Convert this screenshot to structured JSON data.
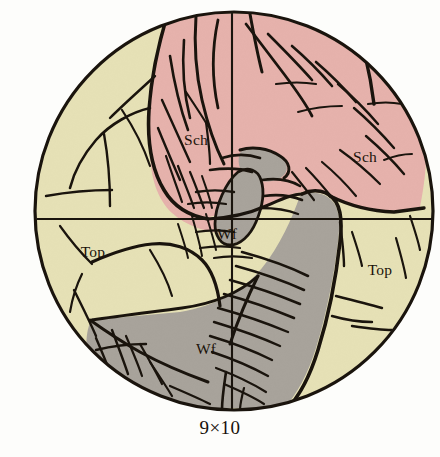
{
  "figure": {
    "name": "petrographic-thin-section",
    "caption": "9×10",
    "field_of_view": {
      "shape": "circle",
      "center_x": 234,
      "center_y": 211,
      "radius": 199,
      "outline_color": "#1a140d",
      "outline_width": 3.2,
      "background_color": "#fdfdfb"
    },
    "crosshair": {
      "vertical_x": 232,
      "horizontal_y": 219,
      "color": "#1a140d",
      "width": 2.1
    },
    "colors": {
      "schist_pink": "#e6b2ac",
      "topaz_yellow": "#e6e1b6",
      "wolframite_gray": "#a8a39b",
      "line_black": "#1a140d",
      "paper_white": "#fdfdfb"
    },
    "legend_abbreviations": [
      {
        "abbr": "Sch",
        "mineral": "Schist"
      },
      {
        "abbr": "Top",
        "mineral": "Topaz"
      },
      {
        "abbr": "Wf",
        "mineral": "Wolframite"
      }
    ],
    "labels": [
      {
        "id": "sch-upper-left",
        "text": "Sch",
        "x": 196,
        "y": 145,
        "anchor": "middle"
      },
      {
        "id": "sch-upper-right",
        "text": "Sch",
        "x": 365,
        "y": 162,
        "anchor": "middle"
      },
      {
        "id": "top-left",
        "text": "Top",
        "x": 93,
        "y": 257,
        "anchor": "middle"
      },
      {
        "id": "top-right",
        "text": "Top",
        "x": 380,
        "y": 275,
        "anchor": "middle"
      },
      {
        "id": "wf-center",
        "text": "Wf",
        "x": 227,
        "y": 239,
        "anchor": "middle"
      },
      {
        "id": "wf-lower",
        "text": "Wf",
        "x": 206,
        "y": 354,
        "anchor": "middle"
      }
    ],
    "regions": [
      {
        "id": "schist-upper",
        "mineral_abbr": "Sch",
        "color": "#e6b2ac"
      },
      {
        "id": "topaz-left",
        "mineral_abbr": "Top",
        "color": "#e6e1b6"
      },
      {
        "id": "topaz-right",
        "mineral_abbr": "Top",
        "color": "#e6e1b6"
      },
      {
        "id": "wolframite-lower",
        "mineral_abbr": "Wf",
        "color": "#a8a39b"
      },
      {
        "id": "wolframite-core",
        "mineral_abbr": "Wf",
        "color": "#a8a39b"
      }
    ]
  }
}
